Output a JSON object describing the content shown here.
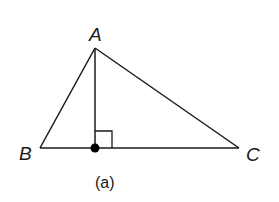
{
  "diagram": {
    "type": "triangle-altitude",
    "stroke_color": "#1a1a1a",
    "background": "#ffffff",
    "vertices": {
      "A": {
        "label": "A",
        "x": 95,
        "y": 48
      },
      "B": {
        "label": "B",
        "x": 40,
        "y": 148
      },
      "C": {
        "label": "C",
        "x": 239,
        "y": 148
      }
    },
    "altitude_foot": {
      "x": 95,
      "y": 148
    },
    "right_angle_marker": {
      "x": 95,
      "y": 131,
      "size": 17
    },
    "caption": "(a)"
  }
}
